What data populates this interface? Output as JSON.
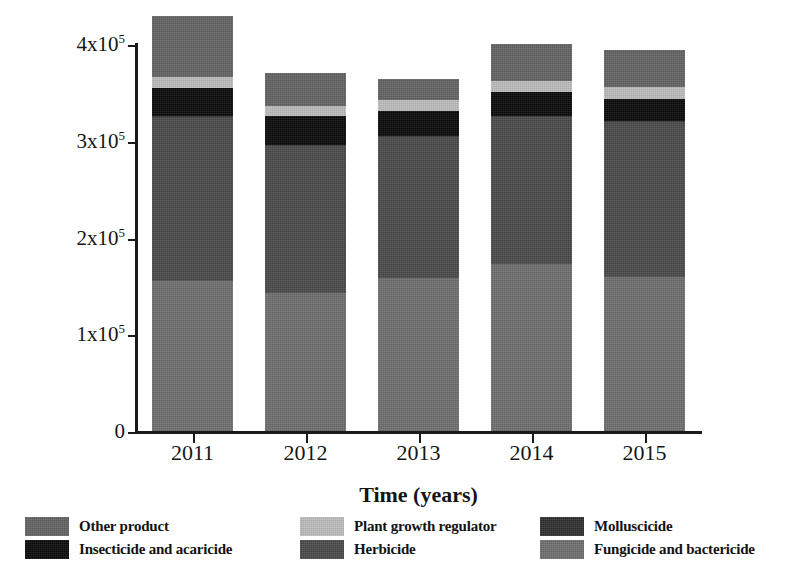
{
  "chart_data": {
    "type": "bar",
    "subtype": "stacked-vertical",
    "title": "",
    "xlabel": "Time (years)",
    "ylabel": "Saled products (tons)",
    "categories": [
      "2011",
      "2012",
      "2013",
      "2014",
      "2015"
    ],
    "ylim": [
      0,
      400000
    ],
    "yticks": [
      0,
      100000,
      200000,
      300000,
      400000
    ],
    "ytick_labels": [
      "0",
      "1x10⁵",
      "2x10⁵",
      "3x10⁵",
      "4x10⁵"
    ],
    "grid": false,
    "legend_position": "bottom",
    "stack_order_bottom_to_top": [
      "Fungicide and bactericide",
      "Herbicide",
      "Molluscicide",
      "Insecticide and acaricide",
      "Plant growth regulator",
      "Other product"
    ],
    "series": [
      {
        "name": "Fungicide and bactericide",
        "color": "#6f6f6f",
        "values": [
          156000,
          144000,
          159000,
          174000,
          160000
        ]
      },
      {
        "name": "Herbicide",
        "color": "#4a4a4a",
        "values": [
          170000,
          152000,
          146000,
          152000,
          160000
        ]
      },
      {
        "name": "Molluscicide",
        "color": "#2f2f2f",
        "values": [
          1000,
          1000,
          1000,
          1000,
          1000
        ]
      },
      {
        "name": "Insecticide and acaricide",
        "color": "#0a0a0a",
        "values": [
          29000,
          30000,
          26000,
          24000,
          23000
        ]
      },
      {
        "name": "Plant growth regulator",
        "color": "#bdbdbd",
        "values": [
          11000,
          10000,
          11000,
          12000,
          13000
        ]
      },
      {
        "name": "Other product",
        "color": "#636363",
        "values": [
          63000,
          34000,
          22000,
          38000,
          38000
        ]
      }
    ],
    "totals": [
      390000,
      371000,
      365000,
      401000,
      395000
    ]
  },
  "axes": {
    "y_title": "Saled products (tons)",
    "x_title": "Time (years)",
    "y_labels": [
      {
        "mantissa": "4x10",
        "exponent": "5",
        "value": 400000
      },
      {
        "mantissa": "3x10",
        "exponent": "5",
        "value": 300000
      },
      {
        "mantissa": "2x10",
        "exponent": "5",
        "value": 200000
      },
      {
        "mantissa": "1x10",
        "exponent": "5",
        "value": 100000
      },
      {
        "mantissa": "0",
        "exponent": "",
        "value": 0
      }
    ],
    "x_labels": [
      "2011",
      "2012",
      "2013",
      "2014",
      "2015"
    ]
  },
  "legend": {
    "columns": [
      {
        "entries": [
          {
            "label": "Other product",
            "swatch_name": "swatch-other-product",
            "color": "#636363"
          },
          {
            "label": "Insecticide and acaricide",
            "swatch_name": "swatch-insecticide-and-acaricide",
            "color": "#0a0a0a"
          }
        ]
      },
      {
        "entries": [
          {
            "label": "Plant growth regulator",
            "swatch_name": "swatch-plant-growth-regulator",
            "color": "#bdbdbd"
          },
          {
            "label": "Herbicide",
            "swatch_name": "swatch-herbicide",
            "color": "#4a4a4a"
          }
        ]
      },
      {
        "entries": [
          {
            "label": "Molluscicide",
            "swatch_name": "swatch-molluscicide",
            "color": "#2f2f2f"
          },
          {
            "label": "Fungicide and bactericide",
            "swatch_name": "swatch-fungicide-and-bactericide",
            "color": "#6f6f6f"
          }
        ]
      }
    ]
  },
  "colors": {
    "axis": "#1a1a1a",
    "background": "#ffffff",
    "text": "#131313"
  }
}
